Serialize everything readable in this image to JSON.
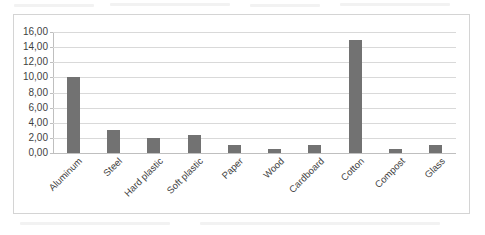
{
  "chart_data": {
    "type": "bar",
    "title": "",
    "xlabel": "",
    "ylabel": "",
    "categories": [
      "Aluminum",
      "Steel",
      "Hard plastic",
      "Soft plastic",
      "Paper",
      "Wood",
      "Cardboard",
      "Cotton",
      "Compost",
      "Glass"
    ],
    "values": [
      10.0,
      3.0,
      2.0,
      2.4,
      1.0,
      0.5,
      1.0,
      15.0,
      0.5,
      1.0
    ],
    "ylim": [
      0,
      16
    ],
    "ytick_step": 2,
    "ytick_labels": [
      "16,00",
      "14,00",
      "12,00",
      "10,00",
      "8,00",
      "6,00",
      "4,00",
      "2,00",
      "0,00"
    ],
    "ytick_values": [
      16,
      14,
      12,
      10,
      8,
      6,
      4,
      2,
      0
    ],
    "grid": true,
    "legend": false,
    "bar_color": "#727272",
    "gridline_color": "#d9d9d9",
    "axis_color": "#bfbfbf",
    "plot_border_color": "#d4d4d4",
    "background_color": "#ffffff"
  }
}
